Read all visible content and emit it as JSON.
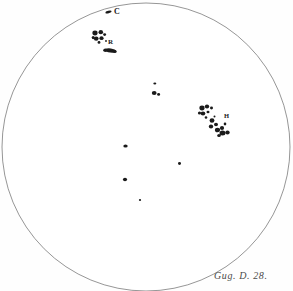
{
  "plate": {
    "title": "Solar disk sunspot drawing",
    "background_color": "#fefefe",
    "ink_color": "#1a1a1a",
    "disk_outline_color": "#8a8a8a"
  },
  "disk": {
    "center_x": 146,
    "center_y": 147,
    "radius": 144,
    "stroke_width": 0.9
  },
  "labels": {
    "c": "C",
    "r": "R",
    "h": "H"
  },
  "signature": {
    "text": "Gug. D. 28."
  },
  "chart_data": {
    "type": "scatter",
    "xlabel": "",
    "ylabel": "",
    "annotations": [
      "C",
      "R",
      "H",
      "Gug. D. 28."
    ],
    "groups": [
      {
        "name": "group-C-marker",
        "label": "C",
        "spots": [
          {
            "cx": 108.5,
            "cy": 12.0,
            "rx": 3.2,
            "ry": 1.3,
            "rot": -12
          }
        ]
      },
      {
        "name": "group-R",
        "label": "R",
        "spots": [
          {
            "cx": 95.0,
            "cy": 33.0,
            "rx": 2.6,
            "ry": 2.4,
            "rot": 0
          },
          {
            "cx": 100.8,
            "cy": 32.2,
            "rx": 2.3,
            "ry": 2.1,
            "rot": 0
          },
          {
            "cx": 104.6,
            "cy": 34.6,
            "rx": 1.5,
            "ry": 1.4,
            "rot": 0
          },
          {
            "cx": 96.2,
            "cy": 38.6,
            "rx": 2.4,
            "ry": 2.2,
            "rot": 0
          },
          {
            "cx": 101.5,
            "cy": 38.2,
            "rx": 2.1,
            "ry": 1.9,
            "rot": 0
          },
          {
            "cx": 93.2,
            "cy": 37.6,
            "rx": 1.5,
            "ry": 1.7,
            "rot": 0
          },
          {
            "cx": 99.0,
            "cy": 42.4,
            "rx": 1.4,
            "ry": 1.3,
            "rot": 0
          },
          {
            "cx": 106.0,
            "cy": 41.0,
            "rx": 0.9,
            "ry": 0.9,
            "rot": 0
          },
          {
            "cx": 110.5,
            "cy": 50.5,
            "rx": 5.6,
            "ry": 2.1,
            "rot": 8
          },
          {
            "cx": 105.4,
            "cy": 50.2,
            "rx": 2.2,
            "ry": 1.7,
            "rot": 0
          },
          {
            "cx": 114.8,
            "cy": 51.4,
            "rx": 1.9,
            "ry": 1.5,
            "rot": 0
          }
        ]
      },
      {
        "name": "group-center-small",
        "label": "",
        "spots": [
          {
            "cx": 154.8,
            "cy": 83.5,
            "rx": 1.5,
            "ry": 1.1,
            "rot": 0
          },
          {
            "cx": 154.2,
            "cy": 93.0,
            "rx": 2.4,
            "ry": 2.1,
            "rot": 0
          },
          {
            "cx": 158.6,
            "cy": 94.4,
            "rx": 1.5,
            "ry": 1.3,
            "rot": 0
          }
        ]
      },
      {
        "name": "group-H",
        "label": "H",
        "spots": [
          {
            "cx": 202.0,
            "cy": 108.0,
            "rx": 2.6,
            "ry": 2.4,
            "rot": 0
          },
          {
            "cx": 207.0,
            "cy": 106.5,
            "rx": 2.2,
            "ry": 2.0,
            "rot": 0
          },
          {
            "cx": 211.5,
            "cy": 108.0,
            "rx": 1.5,
            "ry": 1.4,
            "rot": 0
          },
          {
            "cx": 203.0,
            "cy": 113.5,
            "rx": 2.3,
            "ry": 2.0,
            "rot": 0
          },
          {
            "cx": 208.0,
            "cy": 112.0,
            "rx": 1.5,
            "ry": 1.3,
            "rot": 0
          },
          {
            "cx": 199.5,
            "cy": 113.0,
            "rx": 1.6,
            "ry": 1.5,
            "rot": 0
          },
          {
            "cx": 206.0,
            "cy": 117.5,
            "rx": 1.3,
            "ry": 1.2,
            "rot": 0
          },
          {
            "cx": 212.0,
            "cy": 120.5,
            "rx": 2.4,
            "ry": 2.2,
            "rot": 0
          },
          {
            "cx": 216.0,
            "cy": 124.5,
            "rx": 2.0,
            "ry": 1.8,
            "rot": 0
          },
          {
            "cx": 211.0,
            "cy": 126.5,
            "rx": 2.2,
            "ry": 2.0,
            "rot": 0
          },
          {
            "cx": 217.5,
            "cy": 130.0,
            "rx": 2.6,
            "ry": 2.3,
            "rot": 0
          },
          {
            "cx": 222.0,
            "cy": 128.0,
            "rx": 2.1,
            "ry": 1.9,
            "rot": 0
          },
          {
            "cx": 222.5,
            "cy": 133.0,
            "rx": 3.0,
            "ry": 2.5,
            "rot": 0
          },
          {
            "cx": 227.5,
            "cy": 132.5,
            "rx": 2.2,
            "ry": 2.0,
            "rot": 0
          },
          {
            "cx": 219.0,
            "cy": 135.5,
            "rx": 1.8,
            "ry": 1.5,
            "rot": 0
          },
          {
            "cx": 225.0,
            "cy": 124.0,
            "rx": 1.3,
            "ry": 1.4,
            "rot": 0
          },
          {
            "cx": 214.5,
            "cy": 116.5,
            "rx": 1.0,
            "ry": 1.0,
            "rot": 0
          }
        ]
      },
      {
        "name": "group-isolated-spots",
        "label": "",
        "spots": [
          {
            "cx": 125.5,
            "cy": 146.0,
            "rx": 2.2,
            "ry": 1.6,
            "rot": 0
          },
          {
            "cx": 179.5,
            "cy": 163.5,
            "rx": 1.5,
            "ry": 1.4,
            "rot": 0
          },
          {
            "cx": 125.0,
            "cy": 179.5,
            "rx": 2.1,
            "ry": 1.8,
            "rot": 0
          },
          {
            "cx": 140.0,
            "cy": 200.0,
            "rx": 1.1,
            "ry": 1.0,
            "rot": 0
          }
        ]
      }
    ]
  }
}
